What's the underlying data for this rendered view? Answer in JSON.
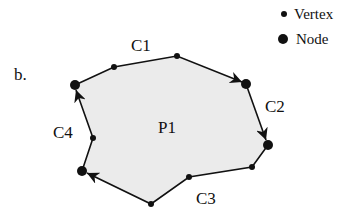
{
  "figure_label": "b.",
  "legend": {
    "vertex_label": "Vertex",
    "node_label": "Node"
  },
  "polygon": {
    "label": "P1",
    "fill": "#ebebeb",
    "stroke": "#111111"
  },
  "curves": [
    {
      "label": "C1"
    },
    {
      "label": "C2"
    },
    {
      "label": "C3"
    },
    {
      "label": "C4"
    }
  ]
}
